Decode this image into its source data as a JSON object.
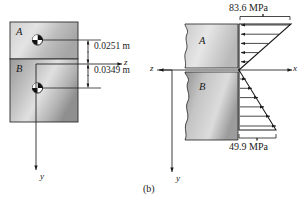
{
  "figure": {
    "caption": "(b)",
    "left_diagram": {
      "name": "composite-cross-section",
      "regions": [
        {
          "id": "A",
          "label": "A",
          "position": "top"
        },
        {
          "id": "B",
          "label": "B",
          "position": "bottom"
        }
      ],
      "centroid_markers": 2,
      "dimensions": [
        {
          "label": "0.0251 m",
          "value": 0.0251,
          "unit": "m",
          "from": "neutral-axis",
          "to": "centroid-A",
          "direction": "up"
        },
        {
          "label": "0.0349 m",
          "value": 0.0349,
          "unit": "m",
          "from": "neutral-axis",
          "to": "centroid-B",
          "direction": "down"
        }
      ],
      "axes": [
        {
          "label": "z",
          "orientation": "horizontal",
          "direction": "right"
        },
        {
          "label": "y",
          "orientation": "vertical",
          "direction": "down"
        }
      ]
    },
    "right_diagram": {
      "name": "bending-stress-distribution",
      "regions": [
        {
          "id": "A",
          "label": "A",
          "position": "top"
        },
        {
          "id": "B",
          "label": "B",
          "position": "bottom"
        }
      ],
      "axes": [
        {
          "label": "x",
          "orientation": "horizontal",
          "direction": "right"
        },
        {
          "label": "y",
          "orientation": "vertical",
          "direction": "down"
        },
        {
          "label": "z",
          "orientation": "horizontal",
          "direction": "left"
        }
      ],
      "stresses": [
        {
          "label": "83.6 MPa",
          "value": 83.6,
          "unit": "MPa",
          "region": "A",
          "sense": "compression",
          "arrow_direction": "left",
          "location": "top"
        },
        {
          "label": "49.9 MPa",
          "value": 49.9,
          "unit": "MPa",
          "region": "B",
          "sense": "tension",
          "arrow_direction": "right",
          "location": "bottom"
        }
      ],
      "arrow_count_top": 5,
      "arrow_count_bottom": 6
    }
  },
  "colors": {
    "line": "#1a1a1a",
    "fill_light": "#d8d8d8",
    "fill_mid": "#b4b4b4",
    "fill_dark": "#8c8c8c",
    "background": "#ffffff"
  }
}
